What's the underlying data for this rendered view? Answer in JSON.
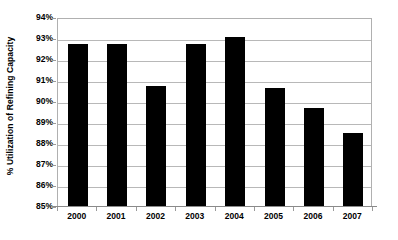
{
  "chart_data": {
    "type": "bar",
    "title": "",
    "subtitle": "",
    "xlabel": "",
    "ylabel": "% Utilization of Refining Capacity",
    "categories": [
      "2000",
      "2001",
      "2002",
      "2003",
      "2004",
      "2005",
      "2006",
      "2007"
    ],
    "values": [
      92.7,
      92.7,
      90.7,
      92.7,
      93.05,
      90.6,
      89.65,
      88.5
    ],
    "series": [
      {
        "name": "% Utilization of Refining Capacity",
        "values": [
          92.7,
          92.7,
          90.7,
          92.7,
          93.05,
          90.6,
          89.65,
          88.5
        ]
      }
    ],
    "ylim": [
      85,
      94
    ],
    "ytick_values": [
      85,
      86,
      87,
      88,
      89,
      90,
      91,
      92,
      93,
      94
    ],
    "ytick_labels": [
      "85%",
      "86%",
      "87%",
      "88%",
      "89%",
      "90%",
      "91%",
      "92%",
      "93%",
      "94%"
    ],
    "grid": true,
    "grid_axis": "y",
    "legend": false,
    "legend_position": "none",
    "bar_color": "#000000",
    "gridline_color": "#b8b8b8",
    "background_color": "#ffffff",
    "annotations": []
  }
}
